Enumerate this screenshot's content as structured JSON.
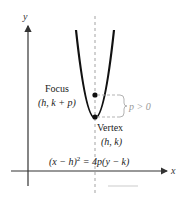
{
  "diagram": {
    "type": "parabola-vertical",
    "axes": {
      "x_label": "x",
      "y_label": "y"
    },
    "labels": {
      "focus_title": "Focus",
      "focus_coords": "(h, k + p)",
      "vertex_title": "Vertex",
      "vertex_coords": "(h, k)",
      "p_condition": "p > 0",
      "equation_lhs": "(x − h)",
      "equation_exp": "2",
      "equation_rhs": " = 4p(y − k)"
    },
    "colors": {
      "curve": "#111111",
      "axis": "#333333",
      "dashed": "#999999",
      "bracket": "#aaaaaa"
    }
  }
}
